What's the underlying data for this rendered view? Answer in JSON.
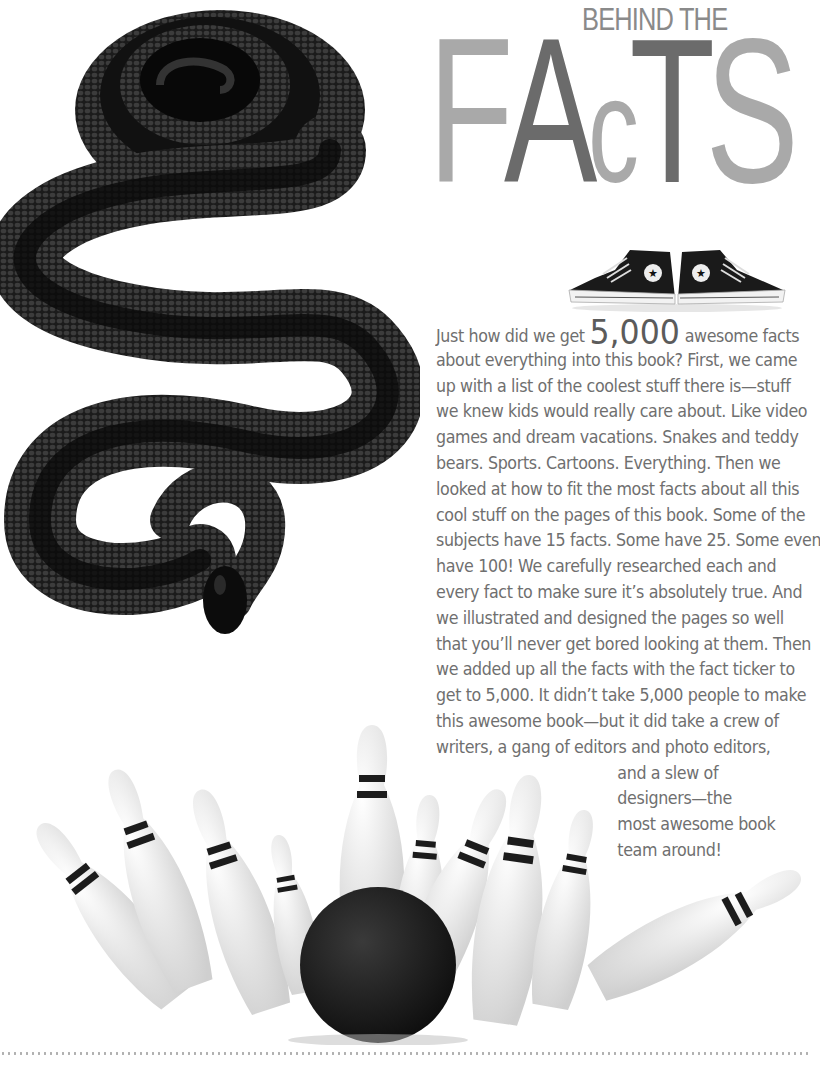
{
  "header": {
    "kicker": "BEHIND THE",
    "title_letters": [
      "F",
      "A",
      "c",
      "T",
      "S"
    ],
    "colors": {
      "light": "#a9a9a9",
      "dark": "#6b6b6b"
    }
  },
  "images": {
    "snake": "black-snake-photo",
    "sneakers": "high-top-sneakers-photo",
    "bowling": "bowling-pins-and-ball-photo"
  },
  "body": {
    "lead_before": "Just how did we get",
    "big_number": "5,000",
    "lead_after": "awesome facts",
    "lines": [
      "about everything into this book? First, we came",
      "up with a list of the coolest stuff there is—stuff",
      "we knew kids would really care about. Like video",
      "games and dream vacations. Snakes and teddy",
      "bears. Sports. Cartoons. Everything. Then we",
      "looked at how to fit the most facts about all this",
      "cool stuff on the pages of this book. Some of the",
      "subjects have 15 facts. Some have 25. Some even",
      "have 100! We carefully researched each and",
      "every fact to make sure it’s absolutely true. And",
      "we illustrated and designed the pages so well",
      "that you’ll never get bored looking at them. Then",
      "we added up all the facts with the fact ticker to",
      "get to 5,000. It didn’t take 5,000 people to make",
      "this awesome book—but it did take a crew of",
      "writers, a gang of editors and photo editors,"
    ],
    "tail_lines": [
      "and a slew of",
      "designers—the",
      "most awesome book",
      "team around!"
    ]
  },
  "footer": {
    "rule": "dotted-rule"
  }
}
